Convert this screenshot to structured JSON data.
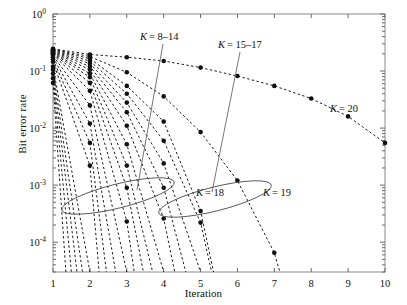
{
  "chart_data": {
    "type": "line",
    "title": "",
    "xlabel": "Iteration",
    "ylabel": "Bit error rate",
    "yscale": "log",
    "xscale": "linear",
    "xlim": [
      1,
      10
    ],
    "ylim": [
      3e-05,
      1.0
    ],
    "grid": false,
    "legend_position": "inline-annotations",
    "marker": "filled-circle",
    "linestyle": "dashed",
    "xticks": [
      1,
      2,
      3,
      4,
      5,
      6,
      7,
      8,
      9,
      10
    ],
    "xtick_labels": [
      "1",
      "2",
      "3",
      "4",
      "5",
      "6",
      "7",
      "8",
      "9",
      "10"
    ],
    "yticks": [
      1.0,
      0.1,
      0.01,
      0.001,
      0.0001
    ],
    "ytick_labels": [
      "10^0",
      "10^-1",
      "10^-2",
      "10^-3",
      "10^-4"
    ],
    "ytick_label_bases": [
      "10",
      "10",
      "10",
      "10",
      "10"
    ],
    "ytick_label_exponents": [
      "0",
      "-1",
      "-2",
      "-3",
      "-4"
    ],
    "series": [
      {
        "name": "K = 1",
        "x": [
          1,
          1.35
        ],
        "y": [
          0.062,
          3e-05
        ]
      },
      {
        "name": "K = 2",
        "x": [
          1,
          1.5
        ],
        "y": [
          0.075,
          3e-05
        ]
      },
      {
        "name": "K = 3",
        "x": [
          1,
          1.65
        ],
        "y": [
          0.09,
          3e-05
        ]
      },
      {
        "name": "K = 4",
        "x": [
          1,
          1.8
        ],
        "y": [
          0.105,
          3e-05
        ]
      },
      {
        "name": "K = 5",
        "x": [
          1,
          2.0
        ],
        "y": [
          0.12,
          3e-05
        ]
      },
      {
        "name": "K = 6",
        "x": [
          1,
          2,
          2.25
        ],
        "y": [
          0.145,
          0.0022,
          3e-05
        ]
      },
      {
        "name": "K = 7",
        "x": [
          1,
          2,
          2.45
        ],
        "y": [
          0.16,
          0.0055,
          3e-05
        ]
      },
      {
        "name": "K = 8",
        "x": [
          1,
          2,
          2.7
        ],
        "y": [
          0.175,
          0.012,
          3e-05
        ]
      },
      {
        "name": "K = 9",
        "x": [
          1,
          2,
          3.0
        ],
        "y": [
          0.185,
          0.025,
          3e-05
        ]
      },
      {
        "name": "K = 10",
        "x": [
          1,
          2,
          3,
          3.2
        ],
        "y": [
          0.195,
          0.045,
          0.00023,
          3e-05
        ]
      },
      {
        "name": "K = 11",
        "x": [
          1,
          2,
          3,
          3.45
        ],
        "y": [
          0.2,
          0.062,
          0.0009,
          3e-05
        ]
      },
      {
        "name": "K = 12",
        "x": [
          1,
          2,
          3,
          3.7
        ],
        "y": [
          0.205,
          0.078,
          0.0022,
          3e-05
        ]
      },
      {
        "name": "K = 13",
        "x": [
          1,
          2,
          3,
          4.0
        ],
        "y": [
          0.21,
          0.09,
          0.0052,
          3e-05
        ]
      },
      {
        "name": "K = 14",
        "x": [
          1,
          2,
          3,
          4,
          4.3
        ],
        "y": [
          0.215,
          0.105,
          0.011,
          0.00026,
          3e-05
        ]
      },
      {
        "name": "K = 15",
        "x": [
          1,
          2,
          3,
          4,
          4.6
        ],
        "y": [
          0.22,
          0.12,
          0.019,
          0.0009,
          3e-05
        ]
      },
      {
        "name": "K = 16",
        "x": [
          1,
          2,
          3,
          4,
          5.0
        ],
        "y": [
          0.225,
          0.135,
          0.028,
          0.0024,
          3e-05
        ]
      },
      {
        "name": "K = 17",
        "x": [
          1,
          2,
          3,
          4,
          5,
          5.3
        ],
        "y": [
          0.23,
          0.15,
          0.04,
          0.006,
          0.00022,
          3e-05
        ]
      },
      {
        "name": "K = 18",
        "x": [
          1,
          2,
          3,
          4,
          5,
          5.35
        ],
        "y": [
          0.235,
          0.165,
          0.055,
          0.013,
          0.00035,
          3e-05
        ]
      },
      {
        "name": "K = 19",
        "x": [
          1,
          2,
          3,
          4,
          5,
          6,
          7,
          7.15
        ],
        "y": [
          0.24,
          0.18,
          0.095,
          0.036,
          0.0085,
          0.0012,
          6.5e-05,
          3e-05
        ]
      },
      {
        "name": "K = 20",
        "x": [
          1,
          2,
          3,
          4,
          5,
          6,
          7,
          8,
          9,
          10
        ],
        "y": [
          0.245,
          0.195,
          0.175,
          0.15,
          0.115,
          0.082,
          0.055,
          0.033,
          0.016,
          0.0055
        ]
      }
    ],
    "annotations": [
      {
        "label": "K = 8–14",
        "label_var": "K",
        "label_rest": "= 8–14"
      },
      {
        "label": "K = 15–17",
        "label_var": "K",
        "label_rest": "= 15–17"
      },
      {
        "label": "K = 18",
        "label_var": "K",
        "label_rest": "= 18"
      },
      {
        "label": "K = 19",
        "label_var": "K",
        "label_rest": "= 19"
      },
      {
        "label": "K = 20",
        "label_var": "K",
        "label_rest": "= 20"
      }
    ],
    "group_ellipses": [
      {
        "label": "K = 8–14",
        "note": "encircles bundle of curves near 10^-3 between iterations 1.5 and 2.5"
      },
      {
        "label": "K = 15–17",
        "note": "encircles bundle of curves near 5x10^-4 between iterations 2.8 and 4.2"
      }
    ]
  },
  "axis": {
    "xlabel": "Iteration",
    "ylabel": "Bit error rate"
  }
}
